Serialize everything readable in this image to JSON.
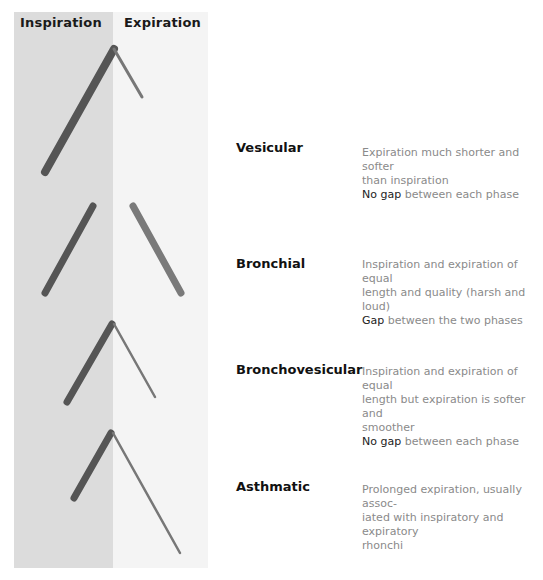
{
  "columns": {
    "inspiration": "Inspiration",
    "expiration": "Expiration"
  },
  "colors": {
    "inspiration_band": "#dcdcdc",
    "expiration_band": "#f4f4f4",
    "inspiration_stroke": "#5a5a5a",
    "expiration_stroke": "#7a7a7a"
  },
  "sounds": [
    {
      "name": "Vesicular",
      "desc_lines": [
        "Expiration much shorter and softer",
        "than inspiration"
      ],
      "gap_emph": "No gap",
      "gap_rest": " between each phase"
    },
    {
      "name": "Bronchial",
      "desc_lines": [
        "Inspiration and expiration of equal",
        "length and quality (harsh and loud)"
      ],
      "gap_emph": "Gap",
      "gap_rest": " between the two phases"
    },
    {
      "name": "Bronchovesicular",
      "desc_lines": [
        "Inspiration and expiration of equal",
        "length but expiration is softer and",
        "smoother"
      ],
      "gap_emph": "No gap",
      "gap_rest": " between each phase"
    },
    {
      "name": "Asthmatic",
      "desc_lines": [
        "Prolonged expiration, usually assoc-",
        "iated with inspiratory and expiratory",
        "rhonchi"
      ],
      "gap_emph": "",
      "gap_rest": ""
    }
  ]
}
